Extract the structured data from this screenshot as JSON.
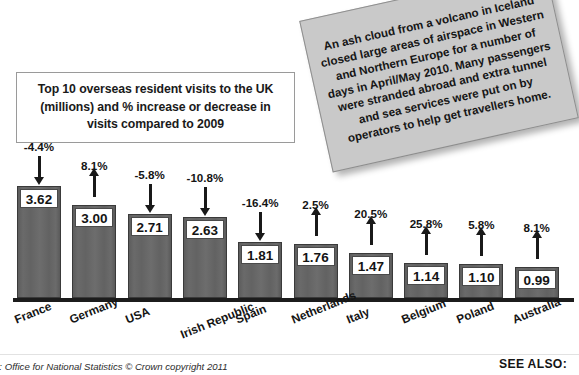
{
  "title_box": {
    "text": "Top 10 overseas resident visits to the UK (millions) and % increase or decrease in visits compared to 2009"
  },
  "callout": {
    "text": "An ash cloud from a volcano in Iceland closed large areas of airspace in Western and Northern Europe for a number of days in April/May 2010. Many passengers were stranded abroad and extra tunnel and sea services were put on by operators to help get travellers home."
  },
  "footer": {
    "source": "e: Office for National Statistics © Crown copyright 2011",
    "see_also": "SEE ALSO:"
  },
  "colors": {
    "bar_fill": "#656565",
    "bar_border": "#3a3a3a",
    "axis": "#1c1c1c",
    "callout_bg": "#c9c9c9",
    "text": "#141414"
  },
  "chart_data": {
    "type": "bar",
    "title": "Top 10 overseas resident visits to the UK (millions) and % increase or decrease in visits compared to 2009",
    "xlabel": "",
    "ylabel": "Visits (millions)",
    "ylim": [
      0,
      4
    ],
    "grid": false,
    "legend": "none",
    "categories": [
      "France",
      "Germany",
      "USA",
      "Irish Republic",
      "Spain",
      "Netherlands",
      "Italy",
      "Belgium",
      "Poland",
      "Australia"
    ],
    "values": [
      3.62,
      3.0,
      2.71,
      2.63,
      1.81,
      1.76,
      1.47,
      1.14,
      1.1,
      0.99
    ],
    "value_labels": [
      "3.62",
      "3.00",
      "2.71",
      "2.63",
      "1.81",
      "1.76",
      "1.47",
      "1.14",
      "1.10",
      "0.99"
    ],
    "annotations": {
      "percent_change": [
        -4.4,
        8.1,
        -5.8,
        -10.8,
        -16.4,
        2.5,
        20.5,
        25.8,
        5.8,
        8.1
      ],
      "percent_labels": [
        "-4.4%",
        "8.1%",
        "-5.8%",
        "-10.8%",
        "-16.4%",
        "2.5%",
        "20.5%",
        "25.8%",
        "5.8%",
        "8.1%"
      ],
      "arrow_directions": [
        "down",
        "up",
        "down",
        "down",
        "down",
        "up",
        "up",
        "up",
        "up",
        "up"
      ]
    }
  }
}
